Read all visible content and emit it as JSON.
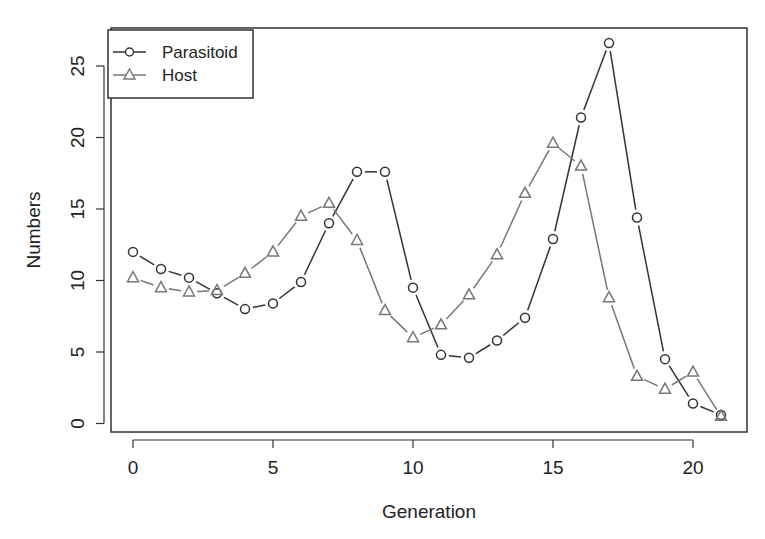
{
  "chart_data": {
    "type": "line",
    "title": "",
    "xlabel": "Generation",
    "ylabel": "Numbers",
    "x": [
      0,
      1,
      2,
      3,
      4,
      5,
      6,
      7,
      8,
      9,
      10,
      11,
      12,
      13,
      14,
      15,
      16,
      17,
      18,
      19,
      20,
      21
    ],
    "xlim": [
      -0.8,
      21.9
    ],
    "ylim": [
      -0.6,
      27.6
    ],
    "xticks": [
      0,
      5,
      10,
      15,
      20
    ],
    "yticks": [
      0,
      5,
      10,
      15,
      20,
      25
    ],
    "grid": false,
    "legend_position": "top-left",
    "series": [
      {
        "name": "Parasitoid",
        "marker": "circle",
        "color": "#333333",
        "values": [
          12.0,
          10.8,
          10.2,
          9.1,
          8.0,
          8.4,
          9.9,
          14.0,
          17.6,
          17.6,
          9.5,
          4.8,
          4.6,
          5.8,
          7.4,
          12.9,
          21.4,
          26.6,
          14.4,
          4.5,
          1.4,
          0.6
        ]
      },
      {
        "name": "Host",
        "marker": "triangle",
        "color": "#777777",
        "values": [
          10.2,
          9.5,
          9.2,
          9.3,
          10.5,
          12.0,
          14.5,
          15.4,
          12.8,
          7.9,
          6.0,
          6.9,
          9.0,
          11.8,
          16.1,
          19.6,
          18.0,
          8.8,
          3.3,
          2.4,
          3.6,
          0.5
        ]
      }
    ]
  },
  "legend": {
    "items": [
      {
        "label": "Parasitoid"
      },
      {
        "label": "Host"
      }
    ]
  }
}
